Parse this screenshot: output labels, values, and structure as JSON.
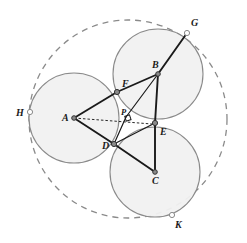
{
  "figure": {
    "canvas": {
      "width": 247,
      "height": 243,
      "background": "#ffffff"
    }
  },
  "style": {
    "circle_stroke": "#8a8a8a",
    "circle_fill": "#f1f1f1",
    "circle_stroke_width": 1.1,
    "dashed_stroke": "#8a8a8a",
    "dashed_stroke_width": 1.3,
    "dash_pattern": "6 5",
    "segment_stroke": "#1a1a1a",
    "segment_stroke_width": 1.9,
    "thin_segment_stroke": "#1a1a1a",
    "thin_segment_stroke_width": 1.2,
    "construction_stroke": "#2a2a2a",
    "construction_dash": "2.5 2",
    "vertex_fill": "#8a8a8a",
    "vertex_stroke": "#333333",
    "open_point_fill": "#ffffff",
    "right_angle_stroke": "#1a1a1a"
  },
  "points": [
    {
      "id": "A",
      "label": "A",
      "x": 74,
      "y": 118,
      "label_x": 62,
      "label_y": 121,
      "marker": "filled",
      "size": 2.3
    },
    {
      "id": "B",
      "label": "B",
      "x": 158,
      "y": 74,
      "label_x": 152,
      "label_y": 68,
      "marker": "filled",
      "size": 2.3
    },
    {
      "id": "C",
      "label": "C",
      "x": 155,
      "y": 172,
      "label_x": 152,
      "label_y": 184,
      "marker": "filled",
      "size": 2.3
    },
    {
      "id": "D",
      "label": "D",
      "x": 114,
      "y": 144,
      "label_x": 102,
      "label_y": 149,
      "marker": "filled",
      "size": 2.6
    },
    {
      "id": "E",
      "label": "E",
      "x": 155,
      "y": 123,
      "label_x": 160,
      "label_y": 135,
      "marker": "filled",
      "size": 2.6
    },
    {
      "id": "F",
      "label": "F",
      "x": 117,
      "y": 92,
      "label_x": 122,
      "label_y": 87,
      "marker": "filled",
      "size": 2.6
    },
    {
      "id": "P",
      "label": "P",
      "x": 126,
      "y": 117,
      "label_x": 121,
      "label_y": 115,
      "marker": "none",
      "size": 0
    },
    {
      "id": "G",
      "label": "G",
      "x": 187,
      "y": 33,
      "label_x": 191,
      "label_y": 26,
      "marker": "open",
      "size": 2.6
    },
    {
      "id": "H",
      "label": "H",
      "x": 30,
      "y": 112,
      "label_x": 16,
      "label_y": 116,
      "marker": "open",
      "size": 2.6
    },
    {
      "id": "K",
      "label": "K",
      "x": 172,
      "y": 215,
      "label_x": 175,
      "label_y": 228,
      "marker": "open",
      "size": 2.6
    }
  ],
  "circles": [
    {
      "id": "circle-A",
      "center": "A",
      "cx": 74,
      "cy": 118,
      "r": 45
    },
    {
      "id": "circle-B",
      "center": "B",
      "cx": 158,
      "cy": 74,
      "r": 45
    },
    {
      "id": "circle-C",
      "center": "C",
      "cx": 155,
      "cy": 172,
      "r": 45
    }
  ],
  "outer_circle": {
    "id": "circumscribing-circle",
    "cx": 128,
    "cy": 119,
    "r": 99,
    "dashed": true
  },
  "segments": [
    {
      "id": "seg-A-F",
      "from": "A",
      "to": "F",
      "x1": 74,
      "y1": 118,
      "x2": 117,
      "y2": 92,
      "weight": "thick"
    },
    {
      "id": "seg-F-B",
      "from": "F",
      "to": "B",
      "x1": 117,
      "y1": 92,
      "x2": 158,
      "y2": 74,
      "weight": "thick"
    },
    {
      "id": "seg-A-D",
      "from": "A",
      "to": "D",
      "x1": 74,
      "y1": 118,
      "x2": 114,
      "y2": 144,
      "weight": "thick"
    },
    {
      "id": "seg-B-P",
      "from": "B",
      "to": "P",
      "x1": 158,
      "y1": 74,
      "x2": 126,
      "y2": 117,
      "weight": "thin"
    },
    {
      "id": "seg-P-D",
      "from": "P",
      "to": "D",
      "x1": 126,
      "y1": 117,
      "x2": 114,
      "y2": 144,
      "weight": "thin"
    },
    {
      "id": "seg-B-E",
      "from": "B",
      "to": "E",
      "x1": 158,
      "y1": 74,
      "x2": 155,
      "y2": 123,
      "weight": "thick"
    },
    {
      "id": "seg-E-C",
      "from": "E",
      "to": "C",
      "x1": 155,
      "y1": 123,
      "x2": 155,
      "y2": 172,
      "weight": "thick"
    },
    {
      "id": "seg-D-C",
      "from": "D",
      "to": "C",
      "x1": 114,
      "y1": 144,
      "x2": 155,
      "y2": 172,
      "weight": "thick"
    },
    {
      "id": "seg-B-G",
      "from": "B",
      "to": "G",
      "x1": 158,
      "y1": 74,
      "x2": 187,
      "y2": 33,
      "weight": "thick"
    },
    {
      "id": "seg-D-E",
      "from": "D",
      "to": "E",
      "x1": 114,
      "y1": 144,
      "x2": 155,
      "y2": 123,
      "weight": "thin"
    }
  ],
  "construction_lines": [
    {
      "id": "dashed-A-P",
      "from": "A",
      "to": "P",
      "x1": 74,
      "y1": 118,
      "x2": 152,
      "y2": 124,
      "style": "dotted"
    }
  ],
  "right_angle_marks": [
    {
      "id": "right-angle-at-P",
      "at": "P",
      "x": 126,
      "y": 117,
      "size": 5,
      "rotation": -18
    }
  ]
}
